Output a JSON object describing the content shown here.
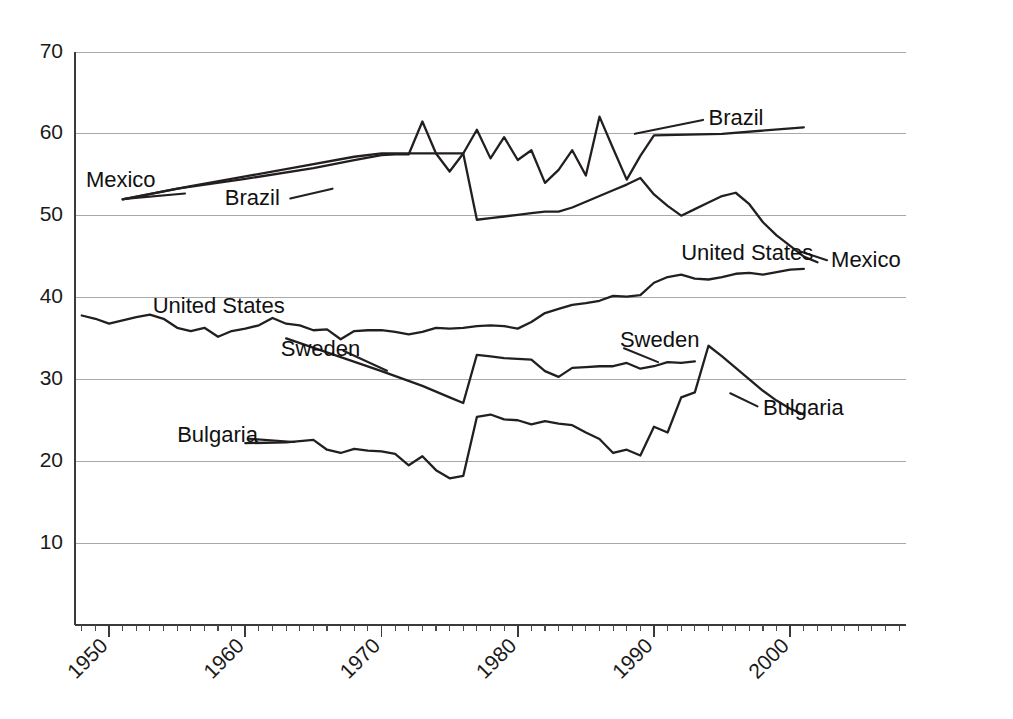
{
  "chart_data": {
    "type": "line",
    "title": "",
    "subtitle": "",
    "xlabel": "",
    "ylabel": "",
    "xlim": [
      1947.5,
      2008.5
    ],
    "ylim": [
      0,
      70
    ],
    "grid": true,
    "grid_axis": "y",
    "legend": "inline-labels",
    "legend_position": "inline",
    "yticks": [
      10,
      20,
      30,
      40,
      50,
      60,
      70
    ],
    "ytick_labels": [
      "10",
      "20",
      "30",
      "40",
      "50",
      "60",
      "70"
    ],
    "xticks": [
      1950,
      1960,
      1970,
      1980,
      1990,
      2000
    ],
    "xtick_labels": [
      "1950",
      "1960",
      "1970",
      "1980",
      "1990",
      "2000"
    ],
    "xtick_minor_step": 1,
    "xtick_label_rotation": 45,
    "line_color": "#231f20",
    "grid_color": "#a8a8a8",
    "axis_color": "#3a3a3a",
    "series": [
      {
        "name": "Brazil",
        "x": [
          1951,
          1955,
          1960,
          1965,
          1968,
          1970,
          1971,
          1972,
          1973,
          1974,
          1975,
          1976,
          1977,
          1978,
          1979,
          1980,
          1981,
          1982,
          1983,
          1984,
          1985,
          1986,
          1987,
          1988,
          1989,
          1990,
          1995,
          2001
        ],
        "values": [
          52.0,
          53.3,
          54.5,
          55.8,
          56.8,
          57.4,
          57.5,
          57.5,
          61.5,
          57.6,
          55.4,
          57.6,
          60.5,
          57.0,
          59.6,
          56.8,
          58.0,
          54.0,
          55.6,
          58.0,
          54.9,
          62.1,
          58.2,
          54.4,
          57.3,
          59.8,
          60.0,
          60.8
        ],
        "labels": [
          {
            "text": "Brazil",
            "x": 1958.5,
            "y": 52.0
          },
          {
            "text": "Brazil",
            "x": 1994.0,
            "y": 61.8
          }
        ]
      },
      {
        "name": "Mexico",
        "x": [
          1951,
          1956,
          1960,
          1964,
          1968,
          1970,
          1971,
          1972,
          1973,
          1974,
          1975,
          1976,
          1977,
          1978,
          1979,
          1980,
          1981,
          1982,
          1983,
          1984,
          1985,
          1986,
          1987,
          1988,
          1989,
          1990,
          1991,
          1992,
          1993,
          1994,
          1995,
          1996,
          1997,
          1998,
          1999,
          2000,
          2001,
          2002
        ],
        "values": [
          52.0,
          53.6,
          54.8,
          56.0,
          57.2,
          57.6,
          57.6,
          57.6,
          57.6,
          57.6,
          57.6,
          57.6,
          49.5,
          49.7,
          49.9,
          50.1,
          50.3,
          50.5,
          50.5,
          51.0,
          51.7,
          52.4,
          53.1,
          53.8,
          54.6,
          52.6,
          51.2,
          50.0,
          50.8,
          51.6,
          52.4,
          52.8,
          51.4,
          49.2,
          47.6,
          46.3,
          45.0,
          44.3
        ],
        "labels": [
          {
            "text": "Mexico",
            "x": 1948.3,
            "y": 54.2
          },
          {
            "text": "Mexico",
            "x": 2003.0,
            "y": 44.4
          }
        ]
      },
      {
        "name": "United States",
        "x": [
          1948,
          1949,
          1950,
          1951,
          1952,
          1953,
          1954,
          1955,
          1956,
          1957,
          1958,
          1959,
          1960,
          1961,
          1962,
          1963,
          1964,
          1965,
          1966,
          1967,
          1968,
          1969,
          1970,
          1971,
          1972,
          1973,
          1974,
          1975,
          1976,
          1977,
          1978,
          1979,
          1980,
          1981,
          1982,
          1983,
          1984,
          1985,
          1986,
          1987,
          1988,
          1989,
          1990,
          1991,
          1992,
          1993,
          1994,
          1995,
          1996,
          1997,
          1998,
          1999,
          2000,
          2001
        ],
        "values": [
          37.8,
          37.4,
          36.8,
          37.2,
          37.6,
          37.9,
          37.4,
          36.3,
          35.9,
          36.3,
          35.2,
          35.9,
          36.2,
          36.6,
          37.5,
          36.8,
          36.6,
          36.0,
          36.1,
          34.9,
          35.9,
          36.0,
          36.0,
          35.8,
          35.5,
          35.8,
          36.3,
          36.2,
          36.3,
          36.5,
          36.6,
          36.5,
          36.2,
          37.0,
          38.1,
          38.6,
          39.1,
          39.3,
          39.6,
          40.2,
          40.1,
          40.3,
          41.8,
          42.5,
          42.8,
          42.3,
          42.2,
          42.5,
          42.9,
          43.0,
          42.8,
          43.1,
          43.4,
          43.5
        ],
        "labels": [
          {
            "text": "United States",
            "x": 1953.2,
            "y": 38.8
          },
          {
            "text": "United States",
            "x": 1992.0,
            "y": 45.3
          }
        ]
      },
      {
        "name": "Sweden",
        "x": [
          1963,
          1970,
          1973,
          1974,
          1975,
          1976,
          1977,
          1978,
          1979,
          1980,
          1981,
          1982,
          1983,
          1984,
          1985,
          1986,
          1987,
          1988,
          1989,
          1990,
          1991,
          1992,
          1993
        ],
        "values": [
          35.0,
          31.0,
          29.2,
          28.5,
          27.8,
          27.1,
          33.0,
          32.8,
          32.6,
          32.5,
          32.4,
          31.0,
          30.3,
          31.4,
          31.5,
          31.6,
          31.6,
          32.0,
          31.3,
          31.6,
          32.1,
          32.0,
          32.2
        ],
        "labels": [
          {
            "text": "Sweden",
            "x": 1962.6,
            "y": 33.6
          },
          {
            "text": "Sweden",
            "x": 1987.5,
            "y": 34.7
          }
        ]
      },
      {
        "name": "Bulgaria",
        "x": [
          1960,
          1963,
          1965,
          1966,
          1967,
          1968,
          1969,
          1970,
          1971,
          1972,
          1973,
          1974,
          1975,
          1976,
          1977,
          1978,
          1979,
          1980,
          1981,
          1982,
          1983,
          1984,
          1985,
          1986,
          1987,
          1988,
          1989,
          1990,
          1991,
          1992,
          1993,
          1994,
          1995,
          1996,
          1997,
          1998,
          1999,
          2000,
          2001
        ],
        "values": [
          22.2,
          22.3,
          22.6,
          21.4,
          21.0,
          21.5,
          21.3,
          21.2,
          20.9,
          19.5,
          20.6,
          18.9,
          17.9,
          18.2,
          25.4,
          25.7,
          25.1,
          25.0,
          24.5,
          24.9,
          24.6,
          24.4,
          23.5,
          22.7,
          21.0,
          21.4,
          20.7,
          24.2,
          23.5,
          27.8,
          28.4,
          34.1,
          32.8,
          31.4,
          30.0,
          28.6,
          27.4,
          26.4,
          25.7
        ],
        "labels": [
          {
            "text": "Bulgaria",
            "x": 1955.0,
            "y": 23.0
          },
          {
            "text": "Bulgaria",
            "x": 1998.0,
            "y": 26.4
          }
        ]
      }
    ],
    "annotations": [
      {
        "text": "Mexico",
        "role": "series-label-left"
      },
      {
        "text": "Brazil",
        "role": "series-label-left"
      },
      {
        "text": "United States",
        "role": "series-label-left"
      },
      {
        "text": "Sweden",
        "role": "series-label-left"
      },
      {
        "text": "Bulgaria",
        "role": "series-label-left"
      },
      {
        "text": "Brazil",
        "role": "series-label-right"
      },
      {
        "text": "Mexico",
        "role": "series-label-right"
      },
      {
        "text": "United States",
        "role": "series-label-right"
      },
      {
        "text": "Sweden",
        "role": "series-label-right"
      },
      {
        "text": "Bulgaria",
        "role": "series-label-right"
      }
    ]
  },
  "figure": {
    "background_color": "#ffffff",
    "width": 1013,
    "height": 719
  }
}
